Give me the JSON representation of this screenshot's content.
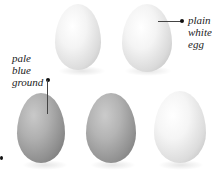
{
  "labels": {
    "plain_white_egg": [
      "plain",
      "white",
      "egg"
    ],
    "pale_blue_ground": [
      "pale",
      "blue",
      "ground"
    ]
  },
  "eggs": [
    {
      "name": "egg-top-left",
      "tone": "white"
    },
    {
      "name": "egg-top-right",
      "tone": "white"
    },
    {
      "name": "egg-bottom-left",
      "tone": "grey"
    },
    {
      "name": "egg-bottom-middle",
      "tone": "grey"
    },
    {
      "name": "egg-bottom-right",
      "tone": "white"
    }
  ],
  "colors": {
    "white_egg_highlight": "#ffffff",
    "white_egg_shade": "#bdbdbd",
    "grey_egg_highlight": "#c8c8c8",
    "grey_egg_shade": "#6e6e6e",
    "text": "#222222"
  }
}
